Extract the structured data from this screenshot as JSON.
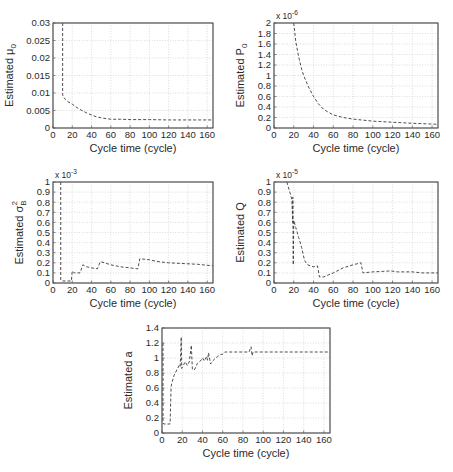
{
  "chart_data": [
    {
      "id": "mu0",
      "type": "line",
      "title": "",
      "xlabel": "Cycle time (cycle)",
      "ylabel": {
        "text": "Estimated μ",
        "sub": "0",
        "sup": ""
      },
      "multiplier": null,
      "xlim": [
        0,
        166
      ],
      "ylim": [
        0,
        0.03
      ],
      "xticks": [
        0,
        20,
        40,
        60,
        80,
        100,
        120,
        140,
        160
      ],
      "xtick_labels": [
        "0",
        "20",
        "40",
        "60",
        "80",
        "100",
        "120",
        "140",
        "160"
      ],
      "yticks": [
        0,
        0.005,
        0.01,
        0.015,
        0.02,
        0.025,
        0.03
      ],
      "ytick_labels": [
        "0",
        "0.005",
        "0.01",
        "0.015",
        "0.02",
        "0.025",
        "0.03"
      ],
      "grid": true,
      "line_style": "dashed",
      "series": [
        {
          "name": "Estimated μ0",
          "points": [
            [
              10,
              0.03
            ],
            [
              10,
              0.0095
            ],
            [
              11,
              0.0088
            ],
            [
              13,
              0.0081
            ],
            [
              15,
              0.0076
            ],
            [
              20,
              0.0068
            ],
            [
              25,
              0.0058
            ],
            [
              30,
              0.005
            ],
            [
              35,
              0.0043
            ],
            [
              40,
              0.0037
            ],
            [
              45,
              0.0032
            ],
            [
              50,
              0.0029
            ],
            [
              55,
              0.0027
            ],
            [
              60,
              0.0025
            ],
            [
              70,
              0.0025
            ],
            [
              80,
              0.0024
            ],
            [
              100,
              0.0024
            ],
            [
              120,
              0.0023
            ],
            [
              140,
              0.0023
            ],
            [
              166,
              0.0023
            ]
          ]
        }
      ]
    },
    {
      "id": "p0",
      "type": "line",
      "title": "",
      "xlabel": "Cycle time (cycle)",
      "ylabel": {
        "text": "Estimated P",
        "sub": "0",
        "sup": ""
      },
      "multiplier": {
        "base": "x 10",
        "exp": "-6"
      },
      "xlim": [
        0,
        166
      ],
      "ylim": [
        0,
        2
      ],
      "xticks": [
        0,
        20,
        40,
        60,
        80,
        100,
        120,
        140,
        160
      ],
      "xtick_labels": [
        "0",
        "20",
        "40",
        "60",
        "80",
        "100",
        "120",
        "140",
        "160"
      ],
      "yticks": [
        0,
        0.2,
        0.4,
        0.6,
        0.8,
        1,
        1.2,
        1.4,
        1.6,
        1.8,
        2
      ],
      "ytick_labels": [
        "0",
        "0.2",
        "0.4",
        "0.6",
        "0.8",
        "1",
        "1.2",
        "1.4",
        "1.6",
        "1.8",
        "2"
      ],
      "grid": true,
      "line_style": "dashed",
      "series": [
        {
          "name": "Estimated P0 (x 1e-6)",
          "points": [
            [
              20,
              2.0
            ],
            [
              22,
              1.65
            ],
            [
              25,
              1.35
            ],
            [
              28,
              1.12
            ],
            [
              30,
              1.0
            ],
            [
              35,
              0.78
            ],
            [
              40,
              0.6
            ],
            [
              45,
              0.46
            ],
            [
              50,
              0.36
            ],
            [
              55,
              0.3
            ],
            [
              60,
              0.25
            ],
            [
              70,
              0.2
            ],
            [
              80,
              0.17
            ],
            [
              90,
              0.15
            ],
            [
              100,
              0.13
            ],
            [
              120,
              0.11
            ],
            [
              140,
              0.09
            ],
            [
              160,
              0.075
            ],
            [
              166,
              0.07
            ]
          ]
        }
      ]
    },
    {
      "id": "sigmaB2",
      "type": "line",
      "title": "",
      "xlabel": "Cycle time (cycle)",
      "ylabel": {
        "text": "Estimated σ",
        "sub": "B",
        "sup": "2"
      },
      "multiplier": {
        "base": "x 10",
        "exp": "-3"
      },
      "xlim": [
        0,
        166
      ],
      "ylim": [
        0,
        1
      ],
      "xticks": [
        0,
        20,
        40,
        60,
        80,
        100,
        120,
        140,
        160
      ],
      "xtick_labels": [
        "0",
        "20",
        "40",
        "60",
        "80",
        "100",
        "120",
        "140",
        "160"
      ],
      "yticks": [
        0,
        0.1,
        0.2,
        0.3,
        0.4,
        0.5,
        0.6,
        0.7,
        0.8,
        0.9,
        1
      ],
      "ytick_labels": [
        "0",
        "0.1",
        "0.2",
        "0.3",
        "0.4",
        "0.5",
        "0.6",
        "0.7",
        "0.8",
        "0.9",
        "1"
      ],
      "grid": true,
      "line_style": "dashed",
      "series": [
        {
          "name": "Estimated σB² (x 1e-3)",
          "points": [
            [
              8,
              1.0
            ],
            [
              8,
              0.03
            ],
            [
              10,
              0.02
            ],
            [
              19,
              0.02
            ],
            [
              20,
              0.12
            ],
            [
              22,
              0.1
            ],
            [
              28,
              0.1
            ],
            [
              31,
              0.18
            ],
            [
              35,
              0.16
            ],
            [
              40,
              0.15
            ],
            [
              46,
              0.14
            ],
            [
              49,
              0.21
            ],
            [
              50,
              0.21
            ],
            [
              60,
              0.18
            ],
            [
              70,
              0.16
            ],
            [
              80,
              0.15
            ],
            [
              88,
              0.14
            ],
            [
              90,
              0.24
            ],
            [
              100,
              0.23
            ],
            [
              110,
              0.21
            ],
            [
              120,
              0.2
            ],
            [
              140,
              0.19
            ],
            [
              150,
              0.185
            ],
            [
              166,
              0.17
            ]
          ]
        }
      ]
    },
    {
      "id": "q",
      "type": "line",
      "title": "",
      "xlabel": "Cycle time (cycle)",
      "ylabel": {
        "text": "Estimated Q",
        "sub": "",
        "sup": ""
      },
      "multiplier": {
        "base": "x 10",
        "exp": "-5"
      },
      "xlim": [
        0,
        166
      ],
      "ylim": [
        0,
        1
      ],
      "xticks": [
        0,
        20,
        40,
        60,
        80,
        100,
        120,
        140,
        160
      ],
      "xtick_labels": [
        "0",
        "20",
        "40",
        "60",
        "80",
        "100",
        "120",
        "140",
        "160"
      ],
      "yticks": [
        0,
        0.1,
        0.2,
        0.3,
        0.4,
        0.5,
        0.6,
        0.7,
        0.8,
        0.9,
        1
      ],
      "ytick_labels": [
        "0",
        "0.1",
        "0.2",
        "0.3",
        "0.4",
        "0.5",
        "0.6",
        "0.7",
        "0.8",
        "0.9",
        "1"
      ],
      "grid": true,
      "line_style": "dashed",
      "series": [
        {
          "name": "Estimated Q (x 1e-5)",
          "points": [
            [
              13,
              1.0
            ],
            [
              16,
              0.9
            ],
            [
              18,
              0.83
            ],
            [
              19,
              0.6
            ],
            [
              19,
              0.85
            ],
            [
              19.5,
              0.18
            ],
            [
              20,
              0.62
            ],
            [
              22,
              0.55
            ],
            [
              25,
              0.45
            ],
            [
              28,
              0.35
            ],
            [
              31,
              0.22
            ],
            [
              34,
              0.18
            ],
            [
              40,
              0.16
            ],
            [
              44,
              0.17
            ],
            [
              46,
              0.06
            ],
            [
              50,
              0.06
            ],
            [
              55,
              0.08
            ],
            [
              60,
              0.1
            ],
            [
              70,
              0.15
            ],
            [
              80,
              0.18
            ],
            [
              88,
              0.2
            ],
            [
              90,
              0.1
            ],
            [
              100,
              0.11
            ],
            [
              110,
              0.115
            ],
            [
              118,
              0.12
            ],
            [
              125,
              0.11
            ],
            [
              140,
              0.11
            ],
            [
              150,
              0.1
            ],
            [
              166,
              0.1
            ]
          ]
        }
      ]
    },
    {
      "id": "a",
      "type": "line",
      "title": "",
      "xlabel": "Cycle time (cycle)",
      "ylabel": {
        "text": "Estimated a",
        "sub": "",
        "sup": ""
      },
      "multiplier": null,
      "xlim": [
        0,
        166
      ],
      "ylim": [
        0,
        1.4
      ],
      "xticks": [
        0,
        20,
        40,
        60,
        80,
        100,
        120,
        140,
        160
      ],
      "xtick_labels": [
        "0",
        "20",
        "40",
        "60",
        "80",
        "100",
        "120",
        "140",
        "160"
      ],
      "yticks": [
        0,
        0.2,
        0.4,
        0.6,
        0.8,
        1,
        1.2,
        1.4
      ],
      "ytick_labels": [
        "0",
        "0.2",
        "0.4",
        "0.6",
        "0.8",
        "1",
        "1.2",
        "1.4"
      ],
      "grid": true,
      "line_style": "dashed",
      "series": [
        {
          "name": "Estimated a",
          "points": [
            [
              1,
              1.2
            ],
            [
              1,
              0.13
            ],
            [
              2,
              0.12
            ],
            [
              8,
              0.12
            ],
            [
              9,
              0.62
            ],
            [
              10,
              0.68
            ],
            [
              12,
              0.77
            ],
            [
              15,
              0.85
            ],
            [
              17,
              0.9
            ],
            [
              18,
              0.88
            ],
            [
              19,
              1.28
            ],
            [
              19.5,
              0.86
            ],
            [
              21,
              0.9
            ],
            [
              23,
              0.95
            ],
            [
              25,
              0.9
            ],
            [
              27,
              0.95
            ],
            [
              29,
              1.17
            ],
            [
              30,
              0.85
            ],
            [
              32,
              0.84
            ],
            [
              35,
              0.93
            ],
            [
              38,
              0.96
            ],
            [
              40,
              1.0
            ],
            [
              42,
              0.96
            ],
            [
              44,
              1.02
            ],
            [
              45,
              0.97
            ],
            [
              46,
              1.07
            ],
            [
              48,
              0.92
            ],
            [
              50,
              0.96
            ],
            [
              53,
              1.0
            ],
            [
              55,
              1.02
            ],
            [
              58,
              1.05
            ],
            [
              60,
              1.05
            ],
            [
              62,
              1.08
            ],
            [
              86,
              1.08
            ],
            [
              88,
              1.15
            ],
            [
              89,
              1.03
            ],
            [
              90,
              1.08
            ],
            [
              166,
              1.08
            ]
          ]
        }
      ]
    }
  ],
  "colors": {
    "line": "#3a3a3a",
    "grid": "#c4c4c4",
    "axes": "#555555",
    "text": "#2a2a2a",
    "background": "#ffffff"
  }
}
